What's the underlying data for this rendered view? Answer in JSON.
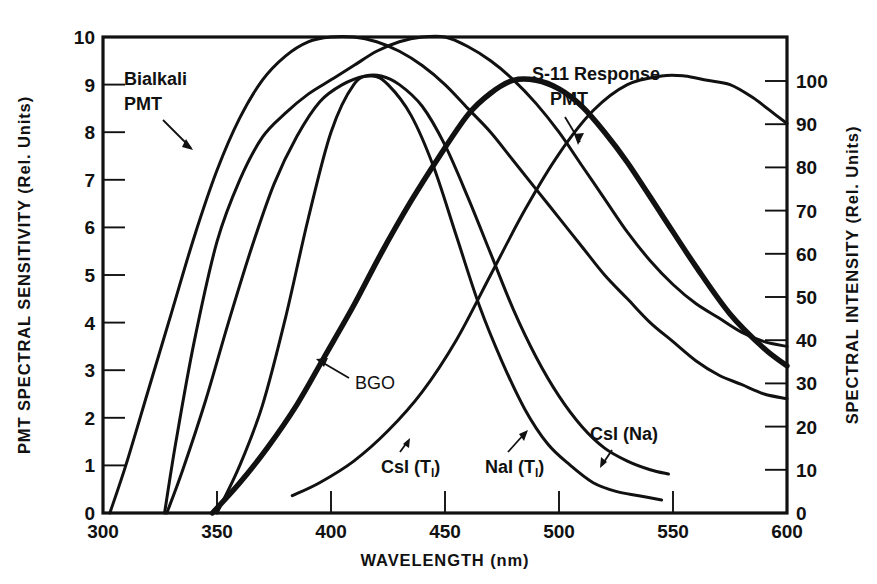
{
  "figure": {
    "background_color": "#ffffff",
    "ink_color": "#111111"
  },
  "chart_data": {
    "type": "line",
    "title": "",
    "xlabel": "WAVELENGTH (nm)",
    "ylabel": "PMT SPECTRAL SENSITIVITY (Rel. Units)",
    "y2label": "SPECTRAL INTENSITY (Rel. Units)",
    "xlim": [
      300,
      600
    ],
    "ylim": [
      0,
      10
    ],
    "y2lim": [
      0,
      110
    ],
    "grid": false,
    "legend_position": "inline-annotations",
    "xticks": [
      300,
      350,
      400,
      450,
      500,
      550,
      600
    ],
    "xtick_labels": [
      "300",
      "350",
      "400",
      "450",
      "500",
      "550",
      "600"
    ],
    "yticks": [
      0,
      1,
      2,
      3,
      4,
      5,
      6,
      7,
      8,
      9,
      10
    ],
    "ytick_labels": [
      "0",
      "1",
      "2",
      "3",
      "4",
      "5",
      "6",
      "7",
      "8",
      "9",
      "10"
    ],
    "y2ticks": [
      0,
      10,
      20,
      30,
      40,
      50,
      60,
      70,
      80,
      90,
      100
    ],
    "y2tick_labels": [
      "0",
      "10",
      "20",
      "30",
      "40",
      "50",
      "60",
      "70",
      "80",
      "90",
      "100"
    ],
    "series": [
      {
        "name": "Bialkali PMT",
        "axis": "left",
        "style": "thin",
        "label": "Bialkali\nPMT",
        "x": [
          303,
          310,
          320,
          330,
          340,
          350,
          360,
          370,
          380,
          390,
          400,
          410,
          420,
          430,
          440,
          450,
          460,
          470,
          480,
          490,
          500,
          510,
          520,
          530,
          540,
          550,
          560,
          570,
          580,
          590,
          600
        ],
        "y": [
          0.0,
          1.0,
          2.6,
          4.2,
          5.8,
          7.2,
          8.3,
          9.1,
          9.6,
          9.9,
          10.0,
          10.0,
          9.9,
          9.7,
          9.4,
          9.0,
          8.5,
          8.0,
          7.4,
          6.8,
          6.2,
          5.6,
          5.0,
          4.5,
          4.0,
          3.6,
          3.2,
          2.9,
          2.7,
          2.5,
          2.4
        ]
      },
      {
        "name": "S-11 Response PMT",
        "axis": "left",
        "style": "thin",
        "label": "S-11 Response\nPMT",
        "x": [
          327,
          332,
          340,
          350,
          360,
          370,
          380,
          390,
          400,
          410,
          420,
          430,
          440,
          450,
          460,
          470,
          480,
          490,
          500,
          510,
          520,
          530,
          540,
          550,
          560,
          570,
          580,
          590,
          600
        ],
        "y": [
          0.0,
          1.5,
          3.6,
          5.7,
          7.0,
          7.9,
          8.4,
          8.8,
          9.1,
          9.4,
          9.7,
          9.9,
          10.0,
          10.0,
          9.8,
          9.5,
          9.1,
          8.6,
          8.0,
          7.3,
          6.6,
          5.9,
          5.3,
          4.8,
          4.4,
          4.1,
          3.8,
          3.6,
          3.5
        ]
      },
      {
        "name": "CsI(Tl)",
        "axis": "right",
        "style": "thin",
        "label": "CsI(Tl)",
        "x": [
          383,
          395,
          410,
          425,
          440,
          455,
          470,
          485,
          500,
          515,
          530,
          545,
          555,
          565,
          575,
          585,
          595,
          600
        ],
        "y": [
          4,
          7,
          12,
          19,
          28,
          40,
          55,
          70,
          83,
          93,
          99,
          101,
          101,
          100,
          99,
          96,
          92,
          90
        ]
      },
      {
        "name": "NaI(Tl)",
        "axis": "right",
        "style": "thin",
        "label": "NaI(Tl)",
        "x": [
          350,
          360,
          370,
          380,
          390,
          400,
          410,
          418,
          425,
          435,
          445,
          455,
          465,
          475,
          485,
          495,
          505,
          515,
          525,
          535,
          545
        ],
        "y": [
          0,
          11,
          25,
          45,
          68,
          88,
          99,
          101,
          99,
          92,
          80,
          64,
          48,
          35,
          24,
          16,
          11,
          7,
          5,
          4,
          3
        ]
      },
      {
        "name": "CsI(Na)",
        "axis": "right",
        "style": "thin",
        "label": "CsI(Na)",
        "x": [
          328,
          335,
          345,
          355,
          365,
          375,
          385,
          395,
          405,
          415,
          422,
          430,
          440,
          450,
          460,
          470,
          480,
          490,
          500,
          510,
          520,
          530,
          540,
          548
        ],
        "y": [
          0,
          10,
          26,
          44,
          61,
          76,
          87,
          95,
          99,
          101,
          101,
          99,
          94,
          85,
          73,
          60,
          47,
          36,
          27,
          20,
          15,
          12,
          10,
          9
        ]
      },
      {
        "name": "BGO",
        "axis": "right",
        "style": "thick",
        "label": "BGO",
        "x": [
          348,
          360,
          372,
          385,
          397,
          410,
          422,
          435,
          447,
          460,
          470,
          480,
          490,
          500,
          510,
          520,
          530,
          545,
          560,
          575,
          590,
          600
        ],
        "y": [
          0,
          7,
          15,
          25,
          36,
          48,
          60,
          72,
          82,
          92,
          97,
          100,
          100,
          98,
          94,
          88,
          81,
          69,
          57,
          46,
          38,
          34
        ]
      }
    ],
    "annotations": [
      {
        "text": "Bialkali PMT",
        "target_series": "Bialkali PMT"
      },
      {
        "text": "S-11 Response PMT",
        "target_series": "S-11 Response PMT"
      },
      {
        "text": "BGO",
        "target_series": "BGO"
      },
      {
        "text": "CsI(Tl)",
        "target_series": "CsI(Tl)"
      },
      {
        "text": "NaI(Tl)",
        "target_series": "NaI(Tl)"
      },
      {
        "text": "CsI(Na)",
        "target_series": "CsI(Na)"
      }
    ]
  },
  "axes": {
    "x": {
      "title": "WAVELENGTH (nm)",
      "labels": [
        "300",
        "350",
        "400",
        "450",
        "500",
        "550",
        "600"
      ]
    },
    "y_left": {
      "title": "PMT SPECTRAL SENSITIVITY (Rel. Units)",
      "labels": [
        "10",
        "9",
        "8",
        "7",
        "6",
        "5",
        "4",
        "3",
        "2",
        "1",
        "0"
      ]
    },
    "y_right": {
      "title": "SPECTRAL INTENSITY (Rel. Units)",
      "labels": [
        "100",
        "90",
        "80",
        "70",
        "60",
        "50",
        "40",
        "30",
        "20",
        "10",
        "0"
      ]
    }
  },
  "labels": {
    "bialkali_line1": "Bialkali",
    "bialkali_line2": "PMT",
    "s11_line1": "S-11 Response",
    "s11_line2": "PMT",
    "bgo": "BGO",
    "csi_tl_main": "CsI (T",
    "csi_tl_sub": "l",
    "csi_tl_end": ")",
    "nai_tl_main": "NaI (T",
    "nai_tl_sub": "l",
    "nai_tl_end": ")",
    "csi_na": "CsI (Na)"
  }
}
